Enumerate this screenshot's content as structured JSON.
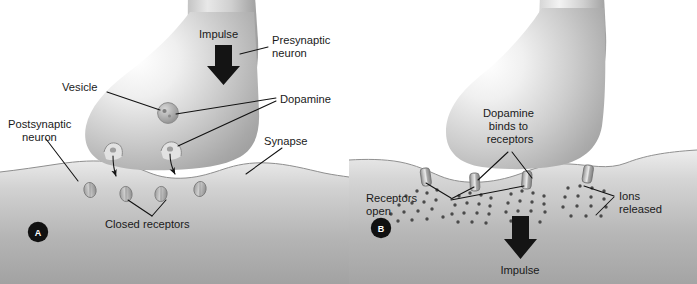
{
  "figure": {
    "background_color": "#ffffff"
  },
  "colors": {
    "ink": "#1a1a1a",
    "leader_line": "#111111",
    "arrow_fill": "#141414",
    "panel_badge_bg": "#111111",
    "panel_badge_text": "#ffffff",
    "neuron_light": "#fefefe",
    "neuron_mid": "#b9b9b9",
    "neuron_dark": "#8d8d8d",
    "membrane_light": "#efefef",
    "membrane_mid": "#b4b4b4",
    "membrane_dark": "#9a9a9a",
    "cleft_white": "#ffffff",
    "receptor_fill": "#b0b0b0",
    "receptor_stroke": "#7a7a7a",
    "ion_fill": "#4a4a4a",
    "vesicle_fill": "#a9a9a9",
    "vesicle_stroke": "#7d7d7d"
  },
  "panel_a": {
    "badge": "A",
    "labels": {
      "impulse": "Impulse",
      "presynaptic_neuron_line1": "Presynaptic",
      "presynaptic_neuron_line2": "neuron",
      "vesicle": "Vesicle",
      "dopamine": "Dopamine",
      "postsynaptic_neuron_line1": "Postsynaptic",
      "postsynaptic_neuron_line2": "neuron",
      "synapse": "Synapse",
      "closed_receptors": "Closed receptors"
    },
    "receptor_state": "closed",
    "receptor_count": 4,
    "vesicle_count": 1,
    "fusion_pore_count": 2,
    "impulse_arrow_direction": "down"
  },
  "panel_b": {
    "badge": "B",
    "labels": {
      "dopamine_binds_line1": "Dopamine",
      "dopamine_binds_line2": "binds to",
      "dopamine_binds_line3": "receptors",
      "receptors_open_line1": "Receptors",
      "receptors_open_line2": "open",
      "ions_released_line1": "Ions",
      "ions_released_line2": "released",
      "impulse": "Impulse"
    },
    "receptor_state": "open",
    "receptor_count": 4,
    "ion_count": 62,
    "impulse_arrow_direction": "down"
  }
}
